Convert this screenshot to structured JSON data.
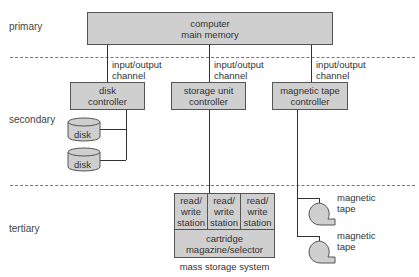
{
  "levels": {
    "primary": "primary",
    "secondary": "secondary",
    "tertiary": "tertiary"
  },
  "main_memory": {
    "label": "computer\nmain memory"
  },
  "channels": [
    {
      "label": "input/output\nchannel"
    },
    {
      "label": "input/output\nchannel"
    },
    {
      "label": "input/output\nchannel"
    }
  ],
  "controllers": [
    {
      "label": "disk\ncontroller"
    },
    {
      "label": "storage unit\ncontroller"
    },
    {
      "label": "magnetic tape\ncontroller"
    }
  ],
  "disks": [
    {
      "label": "disk"
    },
    {
      "label": "disk"
    }
  ],
  "mass_storage": {
    "stations": [
      {
        "label": "read/\nwrite\nstation"
      },
      {
        "label": "read/\nwrite\nstation"
      },
      {
        "label": "read/\nwrite\nstation"
      }
    ],
    "selector": "cartridge\nmagazine/selector",
    "caption": "mass storage system"
  },
  "tapes": [
    {
      "label": "magnetic\ntape"
    },
    {
      "label": "magnetic\ntape"
    }
  ],
  "colors": {
    "box_fill": "#cfcfcf",
    "line": "#333333",
    "dash": "#777777"
  }
}
